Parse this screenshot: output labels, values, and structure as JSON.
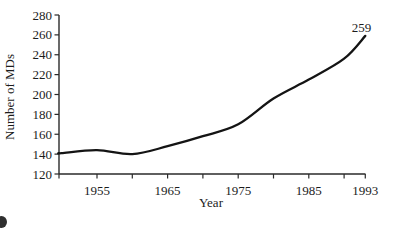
{
  "chart_data": {
    "type": "line",
    "title": "",
    "xlabel": "Year",
    "ylabel": "Number of MDs",
    "x": [
      1950,
      1955,
      1960,
      1965,
      1970,
      1975,
      1980,
      1985,
      1990,
      1993
    ],
    "series": [
      {
        "name": "Number of MDs",
        "values": [
          141,
          144,
          140,
          148,
          158,
          170,
          196,
          215,
          236,
          259
        ]
      }
    ],
    "end_label": "259",
    "xlim": [
      1949.5,
      1993
    ],
    "ylim": [
      120,
      280
    ],
    "grid": false,
    "legend": null,
    "xticks": [
      {
        "year": 1955,
        "label": "1955"
      },
      {
        "year": 1960,
        "label": ""
      },
      {
        "year": 1965,
        "label": "1965"
      },
      {
        "year": 1970,
        "label": ""
      },
      {
        "year": 1975,
        "label": "1975"
      },
      {
        "year": 1980,
        "label": ""
      },
      {
        "year": 1985,
        "label": "1985"
      },
      {
        "year": 1990,
        "label": ""
      },
      {
        "year": 1993,
        "label": "1993"
      }
    ],
    "yticks": [
      {
        "value": 120,
        "label": "120"
      },
      {
        "value": 140,
        "label": "140"
      },
      {
        "value": 160,
        "label": "160"
      },
      {
        "value": 180,
        "label": "180"
      },
      {
        "value": 200,
        "label": "200"
      },
      {
        "value": 220,
        "label": "220"
      },
      {
        "value": 240,
        "label": "240"
      },
      {
        "value": 260,
        "label": "260"
      },
      {
        "value": 280,
        "label": "280"
      }
    ]
  },
  "theme": {
    "background": "#ffffff",
    "line_color": "#141414",
    "axis_color": "#2a2a2a",
    "text_color": "#1c1c1c"
  }
}
